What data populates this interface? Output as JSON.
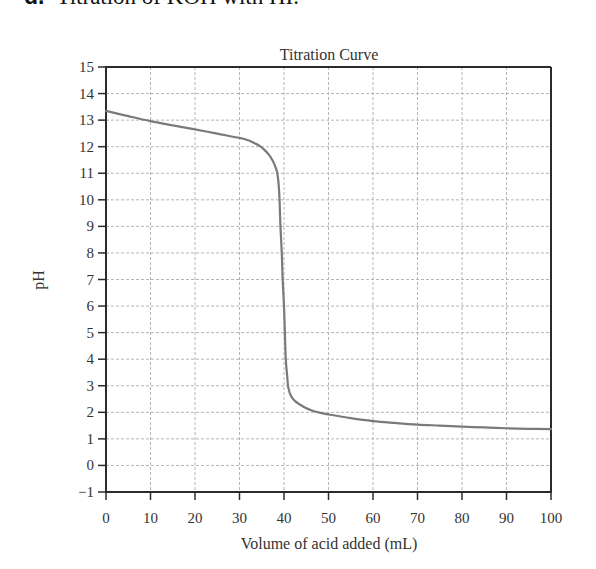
{
  "heading": {
    "letter": "d.",
    "text": "Titration of KOH with HI."
  },
  "chart_data": {
    "type": "line",
    "title": "Titration Curve",
    "xlabel": "Volume of acid added (mL)",
    "ylabel": "pH",
    "xlim": [
      0,
      100
    ],
    "ylim": [
      -1,
      15
    ],
    "xticks": [
      0,
      10,
      20,
      30,
      40,
      50,
      60,
      70,
      80,
      90,
      100
    ],
    "yticks": [
      -1,
      0,
      1,
      2,
      3,
      4,
      5,
      6,
      7,
      8,
      9,
      10,
      11,
      12,
      13,
      14,
      15
    ],
    "ytick_labels": [
      "−1",
      "0",
      "1",
      "2",
      "3",
      "4",
      "5",
      "6",
      "7",
      "8",
      "9",
      "10",
      "11",
      "12",
      "13",
      "14",
      "15"
    ],
    "grid": true,
    "legend": null,
    "series": [
      {
        "name": "Titration of KOH with HI",
        "color": "#7a7a7a",
        "x": [
          0,
          5,
          10,
          15,
          20,
          25,
          30,
          32,
          33.4,
          34.6,
          35.6,
          36.6,
          37.5,
          38.1,
          38.5,
          38.8,
          39.0,
          39.2,
          39.5,
          39.7,
          40.0,
          40.2,
          40.4,
          40.7,
          40.9,
          41.1,
          41.3,
          41.8,
          42.5,
          43.5,
          44.8,
          46.4,
          48.5,
          50,
          55,
          60,
          65,
          70,
          75,
          80,
          85,
          90,
          95,
          100
        ],
        "y": [
          13.35,
          13.15,
          12.96,
          12.8,
          12.65,
          12.49,
          12.33,
          12.24,
          12.13,
          12.02,
          11.88,
          11.7,
          11.46,
          11.22,
          11.0,
          10.56,
          10.0,
          9.0,
          8.0,
          7.0,
          6.0,
          5.0,
          4.0,
          3.4,
          3.0,
          2.85,
          2.72,
          2.55,
          2.42,
          2.3,
          2.17,
          2.06,
          1.97,
          1.92,
          1.78,
          1.67,
          1.6,
          1.54,
          1.5,
          1.46,
          1.43,
          1.4,
          1.38,
          1.37
        ]
      }
    ]
  },
  "colors": {
    "axis": "#2b2b2b",
    "grid": "#b5b5b5",
    "curve": "#7a7a7a",
    "text": "#333333"
  }
}
